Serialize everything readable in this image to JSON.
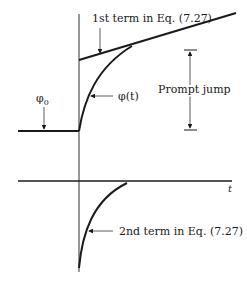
{
  "diagram": {
    "labels": {
      "first_term": "1st term in Eq. (7.27)",
      "second_term": "2nd term in Eq. (7.27)",
      "phi_t": "φ(t)",
      "phi_0_base": "φ",
      "phi_0_sub": "0",
      "prompt_jump": "Prompt jump",
      "t_axis": "t"
    },
    "colors": {
      "line": "#1a1a1a",
      "thin_line": "#333333",
      "background": "#ffffff"
    }
  }
}
